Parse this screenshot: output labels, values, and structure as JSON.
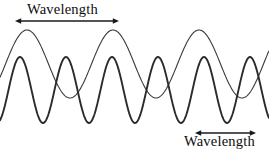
{
  "figure": {
    "width": 269,
    "height": 152,
    "background_color": "#ffffff",
    "stroke_color": "#2b2b2b"
  },
  "labels": {
    "top": {
      "text": "Wavelength",
      "x": 27,
      "y": 2,
      "font_size": 14.5
    },
    "bottom": {
      "text": "Wavelength",
      "x": 184,
      "y": 134,
      "font_size": 14.5
    }
  },
  "annotations": [
    {
      "name": "top-wavelength-arrow",
      "type": "double-headed-arrow",
      "x1": 21,
      "x2": 113,
      "y": 21,
      "length": 92,
      "color": "#1a1a1a"
    },
    {
      "name": "bottom-wavelength-arrow",
      "type": "double-headed-arrow",
      "x1": 201,
      "x2": 250,
      "y": 133,
      "length": 49,
      "color": "#1a1a1a"
    }
  ],
  "chart_data": {
    "type": "line",
    "xlabel": "",
    "ylabel": "",
    "xlim": [
      0,
      269
    ],
    "ylim": [
      0,
      152
    ],
    "grid": false,
    "legend": "none",
    "axes_visible": false,
    "series": [
      {
        "name": "long-wavelength-wave",
        "wave_type": "sine",
        "wavelength_px": 86,
        "amplitude_px": 34,
        "baseline_y": 64,
        "peak_y": 30,
        "trough_y": 98,
        "peaks_x": [
          27,
          113,
          199
        ],
        "troughs_x": [
          70,
          156,
          242
        ],
        "phase_deg": 0,
        "stroke_width": 1.1,
        "color": "#3a3a3a"
      },
      {
        "name": "short-wavelength-wave",
        "wave_type": "sine",
        "wavelength_px": 46,
        "amplitude_px": 33,
        "baseline_y": 90,
        "peak_y": 57,
        "trough_y": 123,
        "peaks_x": [
          20,
          66,
          112,
          157,
          203,
          249
        ],
        "troughs_x": [
          43,
          89,
          134,
          180,
          226
        ],
        "phase_deg": 0,
        "stroke_width": 1.9,
        "color": "#2b2b2b"
      }
    ]
  }
}
